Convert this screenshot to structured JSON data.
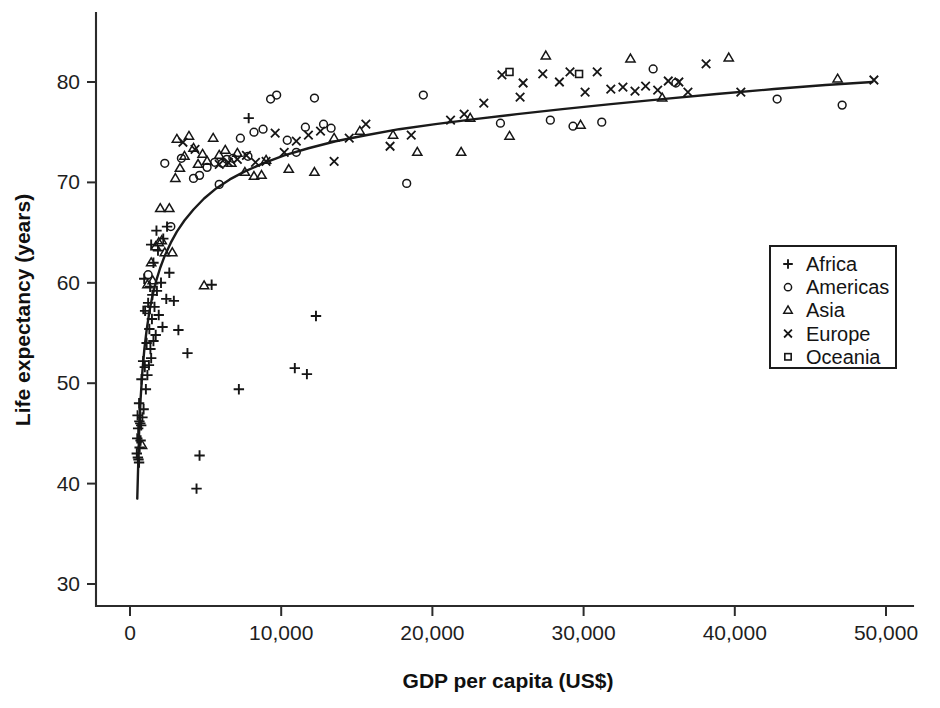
{
  "chart_data": {
    "type": "scatter",
    "title": "",
    "xlabel": "GDP per capita (US$)",
    "ylabel": "Life expectancy (years)",
    "xlim": [
      -800,
      51800
    ],
    "ylim": [
      27.5,
      86.0
    ],
    "xticks": [
      0,
      10000,
      20000,
      30000,
      40000,
      50000
    ],
    "xticklabels": [
      "0",
      "10,000",
      "20,000",
      "30,000",
      "40,000",
      "50,000"
    ],
    "yticks": [
      30,
      40,
      50,
      60,
      70,
      80
    ],
    "yticklabels": [
      "30",
      "40",
      "50",
      "60",
      "70",
      "80"
    ],
    "grid": false,
    "legend_position": "right",
    "marker_color": "#161616",
    "curve_color": "#1a1a1a",
    "fit_curve": {
      "label": "logarithmic fit",
      "points": [
        [
          480,
          38.5
        ],
        [
          600,
          45.0
        ],
        [
          700,
          48.4
        ],
        [
          820,
          51.2
        ],
        [
          950,
          53.4
        ],
        [
          1100,
          55.3
        ],
        [
          1300,
          57.3
        ],
        [
          1500,
          58.8
        ],
        [
          1750,
          60.3
        ],
        [
          2000,
          61.5
        ],
        [
          2300,
          62.7
        ],
        [
          2700,
          64.0
        ],
        [
          3100,
          65.1
        ],
        [
          3600,
          66.2
        ],
        [
          4200,
          67.3
        ],
        [
          4900,
          68.4
        ],
        [
          5700,
          69.4
        ],
        [
          6600,
          70.3
        ],
        [
          7600,
          71.1
        ],
        [
          8800,
          71.9
        ],
        [
          10200,
          72.7
        ],
        [
          11800,
          73.4
        ],
        [
          13600,
          74.1
        ],
        [
          15600,
          74.7
        ],
        [
          17800,
          75.3
        ],
        [
          20200,
          75.8
        ],
        [
          22800,
          76.3
        ],
        [
          25600,
          76.8
        ],
        [
          28600,
          77.3
        ],
        [
          31800,
          77.8
        ],
        [
          35200,
          78.3
        ],
        [
          38800,
          78.8
        ],
        [
          42600,
          79.3
        ],
        [
          46000,
          79.7
        ],
        [
          49100,
          80.0
        ]
      ]
    },
    "series": [
      {
        "name": "Africa",
        "marker": "plus",
        "points": [
          [
            450,
            43.0
          ],
          [
            520,
            42.6
          ],
          [
            560,
            42.4
          ],
          [
            600,
            42.1
          ],
          [
            640,
            43.6
          ],
          [
            480,
            44.5
          ],
          [
            700,
            44.3
          ],
          [
            540,
            45.5
          ],
          [
            620,
            46.2
          ],
          [
            680,
            46.0
          ],
          [
            740,
            45.8
          ],
          [
            500,
            46.8
          ],
          [
            820,
            46.6
          ],
          [
            900,
            47.4
          ],
          [
            600,
            48.0
          ],
          [
            1050,
            49.4
          ],
          [
            760,
            50.4
          ],
          [
            1150,
            50.8
          ],
          [
            980,
            51.6
          ],
          [
            1250,
            51.8
          ],
          [
            870,
            52.2
          ],
          [
            1400,
            52.5
          ],
          [
            1350,
            53.4
          ],
          [
            1100,
            54.0
          ],
          [
            1550,
            54.2
          ],
          [
            1700,
            54.8
          ],
          [
            1280,
            55.4
          ],
          [
            2150,
            55.6
          ],
          [
            1450,
            56.4
          ],
          [
            1900,
            56.8
          ],
          [
            1000,
            57.2
          ],
          [
            1620,
            57.6
          ],
          [
            1200,
            58.0
          ],
          [
            2400,
            58.4
          ],
          [
            1480,
            58.8
          ],
          [
            1780,
            59.2
          ],
          [
            1330,
            59.6
          ],
          [
            2050,
            60.0
          ],
          [
            940,
            60.4
          ],
          [
            2600,
            61.0
          ],
          [
            1550,
            62.0
          ],
          [
            1850,
            63.2
          ],
          [
            1400,
            63.8
          ],
          [
            2200,
            64.4
          ],
          [
            1750,
            65.2
          ],
          [
            2450,
            65.6
          ],
          [
            4600,
            42.8
          ],
          [
            4400,
            39.5
          ],
          [
            7200,
            49.4
          ],
          [
            10900,
            51.5
          ],
          [
            11700,
            50.9
          ],
          [
            12300,
            56.7
          ],
          [
            3800,
            53.0
          ],
          [
            3200,
            55.3
          ],
          [
            2900,
            58.2
          ],
          [
            7850,
            76.4
          ],
          [
            5400,
            59.8
          ]
        ]
      },
      {
        "name": "Americas",
        "marker": "circle",
        "points": [
          [
            1200,
            60.8
          ],
          [
            2700,
            65.6
          ],
          [
            4200,
            70.4
          ],
          [
            4600,
            70.7
          ],
          [
            5100,
            71.5
          ],
          [
            5600,
            72.0
          ],
          [
            6100,
            71.9
          ],
          [
            6800,
            72.4
          ],
          [
            7300,
            74.4
          ],
          [
            7800,
            72.6
          ],
          [
            8200,
            75.0
          ],
          [
            8800,
            75.3
          ],
          [
            9300,
            78.3
          ],
          [
            9700,
            78.7
          ],
          [
            10400,
            74.2
          ],
          [
            11000,
            73.0
          ],
          [
            11600,
            75.5
          ],
          [
            12200,
            78.4
          ],
          [
            12800,
            75.8
          ],
          [
            13300,
            75.4
          ],
          [
            18300,
            69.9
          ],
          [
            19400,
            78.7
          ],
          [
            24500,
            75.9
          ],
          [
            27800,
            76.2
          ],
          [
            29300,
            75.6
          ],
          [
            31200,
            76.0
          ],
          [
            34600,
            81.3
          ],
          [
            36100,
            79.9
          ],
          [
            42800,
            78.3
          ],
          [
            47100,
            77.7
          ],
          [
            5900,
            69.8
          ],
          [
            6400,
            72.3
          ],
          [
            3400,
            72.4
          ],
          [
            2300,
            71.9
          ]
        ]
      },
      {
        "name": "Asia",
        "marker": "triangle",
        "points": [
          [
            800,
            43.8
          ],
          [
            1150,
            59.8
          ],
          [
            1400,
            62.0
          ],
          [
            1700,
            63.6
          ],
          [
            1900,
            64.0
          ],
          [
            2100,
            64.2
          ],
          [
            2300,
            63.0
          ],
          [
            2600,
            67.4
          ],
          [
            3000,
            70.4
          ],
          [
            3300,
            71.4
          ],
          [
            3600,
            72.6
          ],
          [
            3900,
            74.6
          ],
          [
            4200,
            73.4
          ],
          [
            4500,
            71.8
          ],
          [
            4800,
            72.8
          ],
          [
            5100,
            72.1
          ],
          [
            5500,
            74.4
          ],
          [
            5900,
            72.7
          ],
          [
            6300,
            73.2
          ],
          [
            6700,
            71.9
          ],
          [
            7100,
            72.9
          ],
          [
            7600,
            71.0
          ],
          [
            8200,
            70.6
          ],
          [
            9000,
            72.2
          ],
          [
            10500,
            71.3
          ],
          [
            12200,
            71.0
          ],
          [
            13500,
            74.4
          ],
          [
            15200,
            75.1
          ],
          [
            19000,
            73.0
          ],
          [
            21900,
            73.0
          ],
          [
            22500,
            76.4
          ],
          [
            25100,
            74.6
          ],
          [
            27500,
            82.6
          ],
          [
            29800,
            75.7
          ],
          [
            33100,
            82.3
          ],
          [
            35200,
            78.4
          ],
          [
            39600,
            82.4
          ],
          [
            46800,
            80.3
          ],
          [
            4900,
            59.7
          ],
          [
            2800,
            63.0
          ],
          [
            1500,
            60.2
          ],
          [
            3100,
            74.3
          ],
          [
            2000,
            67.4
          ],
          [
            8700,
            70.7
          ],
          [
            17400,
            74.7
          ]
        ]
      },
      {
        "name": "Europe",
        "marker": "cross",
        "points": [
          [
            5900,
            71.8
          ],
          [
            6500,
            72.0
          ],
          [
            7100,
            72.3
          ],
          [
            7700,
            72.7
          ],
          [
            8300,
            72.0
          ],
          [
            9000,
            72.1
          ],
          [
            9600,
            74.9
          ],
          [
            10200,
            73.0
          ],
          [
            11000,
            74.1
          ],
          [
            11800,
            74.7
          ],
          [
            12600,
            75.1
          ],
          [
            13500,
            72.1
          ],
          [
            14500,
            74.4
          ],
          [
            15600,
            75.8
          ],
          [
            17200,
            73.6
          ],
          [
            18600,
            74.7
          ],
          [
            21200,
            76.2
          ],
          [
            22100,
            76.8
          ],
          [
            24600,
            80.7
          ],
          [
            26000,
            79.9
          ],
          [
            27300,
            80.8
          ],
          [
            28400,
            80.0
          ],
          [
            29100,
            81.0
          ],
          [
            30100,
            79.0
          ],
          [
            30900,
            81.0
          ],
          [
            31800,
            79.3
          ],
          [
            32600,
            79.5
          ],
          [
            33400,
            79.1
          ],
          [
            34100,
            79.6
          ],
          [
            34900,
            79.2
          ],
          [
            35600,
            80.1
          ],
          [
            36300,
            80.0
          ],
          [
            36900,
            79.0
          ],
          [
            38100,
            81.8
          ],
          [
            40400,
            79.0
          ],
          [
            49200,
            80.2
          ],
          [
            4300,
            73.3
          ],
          [
            3500,
            74.0
          ],
          [
            25800,
            78.5
          ],
          [
            23400,
            77.9
          ]
        ]
      },
      {
        "name": "Oceania",
        "marker": "square",
        "points": [
          [
            25100,
            81.0
          ],
          [
            29700,
            80.8
          ],
          [
            1100,
            57.3
          ]
        ]
      }
    ]
  },
  "legend": {
    "entries": [
      {
        "label": "Africa",
        "marker": "plus"
      },
      {
        "label": "Americas",
        "marker": "circle"
      },
      {
        "label": "Asia",
        "marker": "triangle"
      },
      {
        "label": "Europe",
        "marker": "cross"
      },
      {
        "label": "Oceania",
        "marker": "square"
      }
    ]
  }
}
